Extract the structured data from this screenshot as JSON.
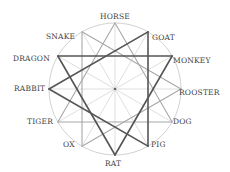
{
  "diagram": {
    "center": {
      "x": 115,
      "y": 89
    },
    "radius": 66,
    "colors": {
      "circle": "#d2d2d2",
      "spoke": "#d6d6d6",
      "light_trine": "#a8a8a8",
      "dark_trine": "#555555",
      "center_dot": "#666666",
      "label": "#444444"
    },
    "signs": [
      {
        "name": "HORSE",
        "angle": 0
      },
      {
        "name": "GOAT",
        "angle": 30
      },
      {
        "name": "MONKEY",
        "angle": 60
      },
      {
        "name": "ROOSTER",
        "angle": 90
      },
      {
        "name": "DOG",
        "angle": 120
      },
      {
        "name": "PIG",
        "angle": 150
      },
      {
        "name": "RAT",
        "angle": 180
      },
      {
        "name": "OX",
        "angle": 210
      },
      {
        "name": "TIGER",
        "angle": 240
      },
      {
        "name": "RABBIT",
        "angle": 270
      },
      {
        "name": "DRAGON",
        "angle": 300
      },
      {
        "name": "SNAKE",
        "angle": 330
      }
    ],
    "trines": [
      {
        "members": [
          "RABBIT",
          "GOAT",
          "PIG"
        ],
        "style": "dark"
      },
      {
        "members": [
          "DRAGON",
          "MONKEY",
          "RAT"
        ],
        "style": "dark"
      },
      {
        "members": [
          "HORSE",
          "DOG",
          "TIGER"
        ],
        "style": "light"
      },
      {
        "members": [
          "SNAKE",
          "ROOSTER",
          "OX"
        ],
        "style": "light"
      }
    ],
    "labels": {
      "horse": "HORSE",
      "goat": "GOAT",
      "monkey": "MONKEY",
      "rooster": "ROOSTER",
      "dog": "DOG",
      "pig": "PIG",
      "rat": "RAT",
      "ox": "OX",
      "tiger": "TIGER",
      "rabbit": "RABBIT",
      "dragon": "DRAGON",
      "snake": "SNAKE"
    }
  }
}
